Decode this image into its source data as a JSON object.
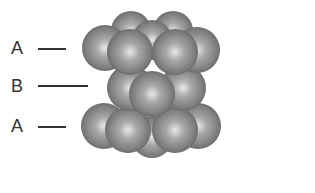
{
  "diagram": {
    "layers": [
      {
        "label": "A",
        "position": "top"
      },
      {
        "label": "B",
        "position": "middle"
      },
      {
        "label": "A",
        "position": "bottom"
      }
    ],
    "sphere_color": "#8a8a8a",
    "highlight_color": "#e6e6e6",
    "shadow_color": "#555555"
  }
}
